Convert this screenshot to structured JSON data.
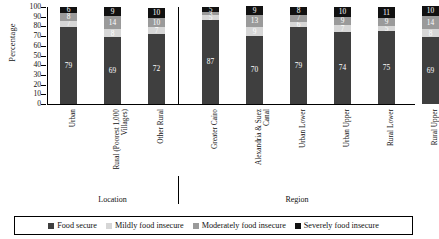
{
  "chart_data": {
    "type": "bar",
    "subtype": "stacked-column-100",
    "title": "",
    "xlabel": "",
    "ylabel": "Percentage",
    "ylim": [
      0,
      100
    ],
    "yticks": [
      100,
      90,
      80,
      70,
      60,
      50,
      40,
      30,
      20,
      10,
      0
    ],
    "grid": false,
    "legend_position": "bottom",
    "categories": [
      "Urban",
      "Rural (Poorest 1,000 Villages)",
      "Other Rural",
      "Greater Cairo",
      "Alexandria & Suez Canal",
      "Urban Lower",
      "Urban Upper",
      "Rural Lower",
      "Rural Upper"
    ],
    "groups": [
      {
        "label": "Location",
        "categories": [
          "Urban",
          "Rural (Poorest 1,000 Villages)",
          "Other Rural"
        ]
      },
      {
        "label": "Region",
        "categories": [
          "Greater Cairo",
          "Alexandria & Suez Canal",
          "Urban Lower",
          "Urban Upper",
          "Rural Lower",
          "Rural Upper"
        ]
      }
    ],
    "series": [
      {
        "name": "Food secure",
        "color": "#3f3f3f",
        "values": [
          79,
          69,
          72,
          87,
          70,
          79,
          74,
          75,
          69
        ]
      },
      {
        "name": "Mildly food insecure",
        "color": "#d6d6d6",
        "values": [
          7,
          8,
          7,
          5,
          9,
          6,
          7,
          5,
          8
        ]
      },
      {
        "name": "Moderately food insecure",
        "color": "#9a9a9a",
        "values": [
          8,
          14,
          10,
          3,
          13,
          7,
          9,
          9,
          14
        ]
      },
      {
        "name": "Severely food insecure",
        "color": "#111111",
        "values": [
          6,
          9,
          10,
          5,
          9,
          8,
          10,
          11,
          10
        ]
      }
    ]
  },
  "legend": {
    "items": [
      {
        "label": "Food secure",
        "color": "#3f3f3f"
      },
      {
        "label": "Mildly food insecure",
        "color": "#d6d6d6"
      },
      {
        "label": "Moderately food insecure",
        "color": "#9a9a9a"
      },
      {
        "label": "Severely food insecure",
        "color": "#111111"
      }
    ]
  }
}
